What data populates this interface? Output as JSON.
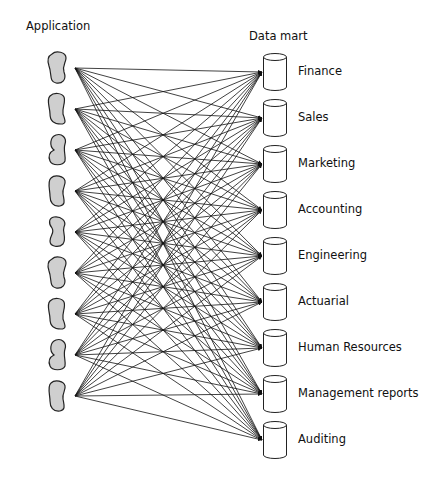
{
  "diagram": {
    "left_header": "Application",
    "right_header": "Data mart",
    "applications": [
      {
        "name": "application-1",
        "y": 68
      },
      {
        "name": "application-2",
        "y": 109
      },
      {
        "name": "application-3",
        "y": 150
      },
      {
        "name": "application-4",
        "y": 191
      },
      {
        "name": "application-5",
        "y": 232
      },
      {
        "name": "application-6",
        "y": 273
      },
      {
        "name": "application-7",
        "y": 314
      },
      {
        "name": "application-8",
        "y": 355
      },
      {
        "name": "application-9",
        "y": 396
      }
    ],
    "data_marts": [
      {
        "label": "Finance",
        "y": 72
      },
      {
        "label": "Sales",
        "y": 118
      },
      {
        "label": "Marketing",
        "y": 164
      },
      {
        "label": "Accounting",
        "y": 210
      },
      {
        "label": "Engineering",
        "y": 256
      },
      {
        "label": "Actuarial",
        "y": 302
      },
      {
        "label": "Human Resources",
        "y": 348
      },
      {
        "label": "Management reports",
        "y": 394
      },
      {
        "label": "Auditing",
        "y": 440
      }
    ],
    "connections": "every application connects to every data mart (many-to-many)",
    "colors": {
      "app_fill": "#cfcfcf",
      "stroke": "#222222",
      "line": "#111111"
    }
  }
}
